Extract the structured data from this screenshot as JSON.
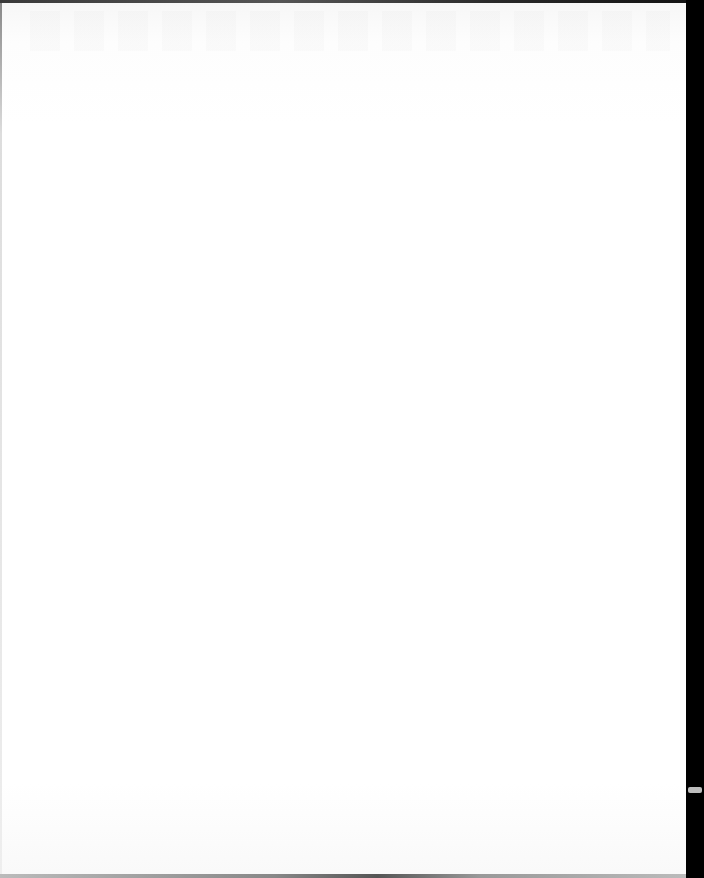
{
  "document": {
    "type": "scanned-page",
    "content": "",
    "colors": {
      "paper": "#ffffff",
      "scan_border": "#000000"
    }
  }
}
